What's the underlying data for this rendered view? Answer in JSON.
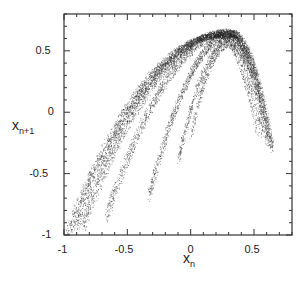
{
  "chart_data": {
    "type": "scatter",
    "title": "",
    "xlabel": "x_n",
    "ylabel": "x_{n+1}",
    "xlabel_main": "x",
    "xlabel_sub": "n",
    "ylabel_main": "x",
    "ylabel_sub": "n+1",
    "xlim": [
      -1,
      0.8
    ],
    "ylim": [
      -1,
      0.8
    ],
    "x_ticks": [
      -1,
      -0.5,
      0,
      0.5
    ],
    "x_tick_labels": [
      "-1",
      "-0.5",
      "0",
      "0.5"
    ],
    "y_ticks": [
      -1,
      -0.5,
      0,
      0.5
    ],
    "y_tick_labels": [
      "-1",
      "-0.5",
      "0",
      "0.5"
    ],
    "minor_tick_step": 0.1,
    "grid": false,
    "legend": null,
    "band_starts": [
      {
        "x": -0.98,
        "y": -0.98
      },
      {
        "x": -0.92,
        "y": -0.95
      },
      {
        "x": -0.85,
        "y": -0.93
      },
      {
        "x": -0.67,
        "y": -0.85
      },
      {
        "x": -0.33,
        "y": -0.68
      }
    ],
    "peak": {
      "x": 0.3,
      "y": 0.65
    },
    "right_end": {
      "x": 0.65,
      "y": -0.2
    },
    "point_color": "#222222",
    "point_count": 9000
  }
}
